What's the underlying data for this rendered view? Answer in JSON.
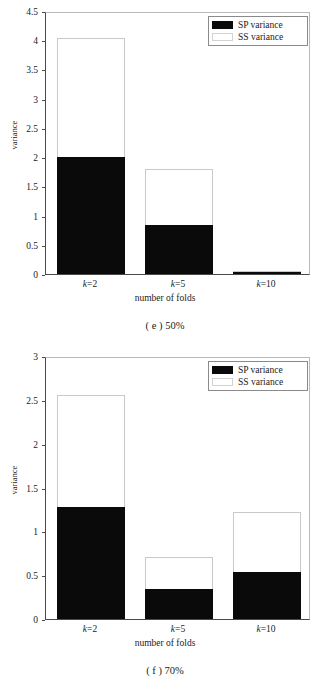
{
  "chart_data": [
    {
      "type": "bar",
      "id": "e",
      "caption": "( e ) 50%",
      "title": "",
      "xlabel": "number of folds",
      "ylabel": "variance",
      "categories": [
        "k=2",
        "k=5",
        "k=10"
      ],
      "stacked": true,
      "ylim": [
        0,
        4.5
      ],
      "yticks": [
        "0",
        "0.5",
        "1",
        "1.5",
        "2",
        "2.5",
        "3",
        "3.5",
        "4",
        "4.5"
      ],
      "ytick_values": [
        0,
        0.5,
        1,
        1.5,
        2,
        2.5,
        3,
        3.5,
        4,
        4.5
      ],
      "grid": false,
      "legend_position": "top-right",
      "series": [
        {
          "name": "SP variance",
          "color": "#0a0a0a",
          "values": [
            2.0,
            0.84,
            0.04
          ]
        },
        {
          "name": "SS variance",
          "color": "#ffffff",
          "values": [
            2.03,
            0.96,
            0.01
          ]
        }
      ],
      "totals": [
        4.03,
        1.8,
        0.05
      ]
    },
    {
      "type": "bar",
      "id": "f",
      "caption": "( f ) 70%",
      "title": "",
      "xlabel": "number of folds",
      "ylabel": "variance",
      "categories": [
        "k=2",
        "k=5",
        "k=10"
      ],
      "stacked": true,
      "ylim": [
        0,
        3
      ],
      "yticks": [
        "0",
        "0.5",
        "1",
        "1.5",
        "2",
        "2.5",
        "3"
      ],
      "ytick_values": [
        0,
        0.5,
        1,
        1.5,
        2,
        2.5,
        3
      ],
      "grid": false,
      "legend_position": "top-right",
      "series": [
        {
          "name": "SP variance",
          "color": "#0a0a0a",
          "values": [
            1.28,
            0.34,
            0.54
          ]
        },
        {
          "name": "SS variance",
          "color": "#ffffff",
          "values": [
            1.27,
            0.37,
            0.68
          ]
        }
      ],
      "totals": [
        2.55,
        0.71,
        1.22
      ]
    }
  ],
  "figures": {
    "e": {
      "caption": "( e ) 50%",
      "xlabel": "number of folds",
      "ylabel": "variance",
      "legend": {
        "sp": "SP variance",
        "ss": "SS variance"
      },
      "xticks": [
        {
          "prefix": "k",
          "suffix": "=2"
        },
        {
          "prefix": "k",
          "suffix": "=5"
        },
        {
          "prefix": "k",
          "suffix": "=10"
        }
      ]
    },
    "f": {
      "caption": "( f ) 70%",
      "xlabel": "number of folds",
      "ylabel": "variance",
      "legend": {
        "sp": "SP variance",
        "ss": "SS variance"
      },
      "xticks": [
        {
          "prefix": "k",
          "suffix": "=2"
        },
        {
          "prefix": "k",
          "suffix": "=5"
        },
        {
          "prefix": "k",
          "suffix": "=10"
        }
      ]
    }
  }
}
